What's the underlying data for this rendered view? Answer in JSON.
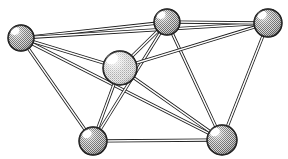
{
  "figure": {
    "type": "node-link-diagram",
    "width": 288,
    "height": 159,
    "background_color": "#ffffff",
    "edge_style": "double-line-tube",
    "edge_outline_color": "#1a1a1a",
    "edge_fill_color": "#ffffff",
    "node_outline_color": "#111111",
    "node_highlight_color": "#ffffff"
  },
  "graph_data": {
    "type": "graph",
    "node_count": 6,
    "edge_count": 12,
    "nodes": [
      {
        "id": "left",
        "label": "",
        "cx": 21,
        "cy": 38,
        "r": 13,
        "shade": "dark",
        "fill": "#8e8e8e",
        "highlight_cx": 15,
        "highlight_cy": 31,
        "highlight_r": 4.0,
        "degree": 5
      },
      {
        "id": "top-middle",
        "label": "",
        "cx": 167,
        "cy": 22,
        "r": 13,
        "shade": "dark",
        "fill": "#8e8e8e",
        "highlight_cx": 161,
        "highlight_cy": 15,
        "highlight_r": 4.0,
        "degree": 5
      },
      {
        "id": "top-right",
        "label": "",
        "cx": 268,
        "cy": 23,
        "r": 14,
        "shade": "dark",
        "fill": "#8e8e8e",
        "highlight_cx": 262,
        "highlight_cy": 15,
        "highlight_r": 4.2,
        "degree": 4
      },
      {
        "id": "center",
        "label": "",
        "cx": 120,
        "cy": 68,
        "r": 17,
        "shade": "light",
        "fill": "#b9b9b9",
        "highlight_cx": 112,
        "highlight_cy": 59,
        "highlight_r": 5.4,
        "degree": 5
      },
      {
        "id": "bottom-left",
        "label": "",
        "cx": 93,
        "cy": 141,
        "r": 14,
        "shade": "dark",
        "fill": "#8e8e8e",
        "highlight_cx": 87,
        "highlight_cy": 134,
        "highlight_r": 4.2,
        "degree": 5
      },
      {
        "id": "bottom-right",
        "label": "",
        "cx": 222,
        "cy": 140,
        "r": 15,
        "shade": "dark",
        "fill": "#8e8e8e",
        "highlight_cx": 215,
        "highlight_cy": 132,
        "highlight_r": 4.4,
        "degree": 5
      }
    ],
    "edges": [
      {
        "id": "e1",
        "source": "left",
        "target": "top-middle"
      },
      {
        "id": "e2",
        "source": "left",
        "target": "top-right"
      },
      {
        "id": "e3",
        "source": "left",
        "target": "center"
      },
      {
        "id": "e4",
        "source": "left",
        "target": "bottom-left"
      },
      {
        "id": "e5",
        "source": "left",
        "target": "bottom-right"
      },
      {
        "id": "e6",
        "source": "top-middle",
        "target": "top-right"
      },
      {
        "id": "e7",
        "source": "top-middle",
        "target": "center"
      },
      {
        "id": "e8",
        "source": "top-middle",
        "target": "bottom-left"
      },
      {
        "id": "e9",
        "source": "top-middle",
        "target": "bottom-right"
      },
      {
        "id": "e10",
        "source": "top-right",
        "target": "center"
      },
      {
        "id": "e11",
        "source": "top-right",
        "target": "bottom-right"
      },
      {
        "id": "e12",
        "source": "center",
        "target": "bottom-left"
      },
      {
        "id": "e13",
        "source": "center",
        "target": "bottom-right"
      },
      {
        "id": "e14",
        "source": "bottom-left",
        "target": "bottom-right"
      }
    ]
  }
}
